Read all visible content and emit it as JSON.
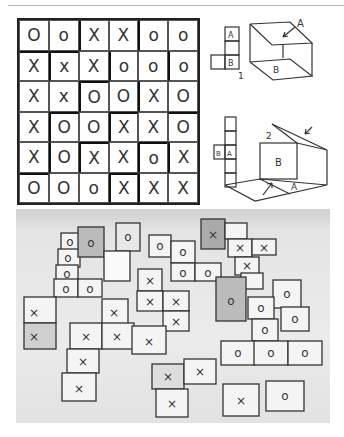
{
  "grid": {
    "rows": [
      [
        "O",
        "o",
        "X",
        "X",
        "o",
        "o"
      ],
      [
        "X",
        "x",
        "X",
        "o",
        "o",
        "o"
      ],
      [
        "X",
        "x",
        "O",
        "O",
        "X",
        "O"
      ],
      [
        "X",
        "O",
        "O",
        "X",
        "X",
        "O"
      ],
      [
        "X",
        "O",
        "X",
        "X",
        "o",
        "X"
      ],
      [
        "O",
        "O",
        "o",
        "X",
        "X",
        "X"
      ]
    ]
  },
  "diagram1": {
    "label_top": "A",
    "label_bottom": "B",
    "number": "1",
    "cube_label_a": "A",
    "cube_label_b": "B"
  },
  "diagram2": {
    "label_left": "B",
    "label_right": "A",
    "number": "2",
    "box_label_b": "B",
    "box_label_a": "A"
  },
  "photo": {
    "description": "photograph of folded paper cube nets marked with X and O"
  }
}
